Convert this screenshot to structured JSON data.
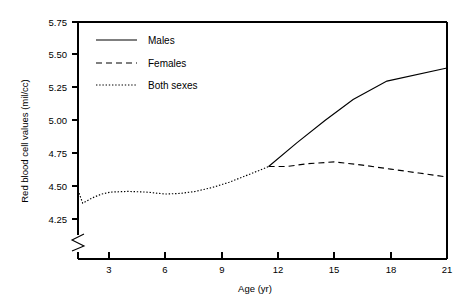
{
  "chart_data": {
    "type": "line",
    "title": "",
    "xlabel": "Age (yr)",
    "ylabel": "Red blood cell values (mil/cc)",
    "xlim": [
      1.3,
      21
    ],
    "ylim": [
      4.15,
      5.75
    ],
    "y_axis_break": true,
    "grid": false,
    "legend_position": "top-left inside plot",
    "xticks": [
      3,
      6,
      9,
      12,
      15,
      18,
      21
    ],
    "xtick_labels": [
      "3",
      "6",
      "9",
      "12",
      "15",
      "18",
      "21"
    ],
    "yticks": [
      4.25,
      4.5,
      4.75,
      5.0,
      5.25,
      5.5,
      5.75
    ],
    "ytick_labels": [
      "4.25",
      "4.50",
      "4.75",
      "5.00",
      "5.25",
      "5.50",
      "5.75"
    ],
    "series": [
      {
        "name": "Males",
        "style": "solid",
        "x": [
          11.5,
          13.0,
          14.5,
          16.0,
          17.8,
          21.0
        ],
        "values": [
          4.65,
          4.83,
          5.0,
          5.16,
          5.3,
          5.4
        ]
      },
      {
        "name": "Females",
        "style": "dashed",
        "x": [
          11.5,
          12.5,
          13.5,
          15.0,
          16.5,
          18.0,
          19.5,
          21.0
        ],
        "values": [
          4.65,
          4.65,
          4.67,
          4.685,
          4.66,
          4.63,
          4.6,
          4.57
        ]
      },
      {
        "name": "Both sexes",
        "style": "dotted",
        "x": [
          1.35,
          1.6,
          2.1,
          2.6,
          3.1,
          4.0,
          5.0,
          6.0,
          6.8,
          7.6,
          8.5,
          9.4,
          10.3,
          11.0,
          11.5
        ],
        "values": [
          4.47,
          4.37,
          4.41,
          4.44,
          4.455,
          4.46,
          4.455,
          4.44,
          4.445,
          4.46,
          4.49,
          4.53,
          4.58,
          4.62,
          4.65
        ]
      }
    ]
  },
  "axes": {
    "y_title": "Red blood cell values (mil/cc)",
    "x_title": "Age (yr)",
    "y_labels": {
      "t0": "4.25",
      "t1": "4.50",
      "t2": "4.75",
      "t3": "5.00",
      "t4": "5.25",
      "t5": "5.50",
      "t6": "5.75"
    },
    "x_labels": {
      "t0": "3",
      "t1": "6",
      "t2": "9",
      "t3": "12",
      "t4": "15",
      "t5": "18",
      "t6": "21"
    }
  },
  "legend": {
    "entries": {
      "e0": "Males",
      "e1": "Females",
      "e2": "Both sexes"
    }
  },
  "colors": {
    "line": "#000000",
    "background": "#ffffff",
    "axis": "#000000"
  }
}
